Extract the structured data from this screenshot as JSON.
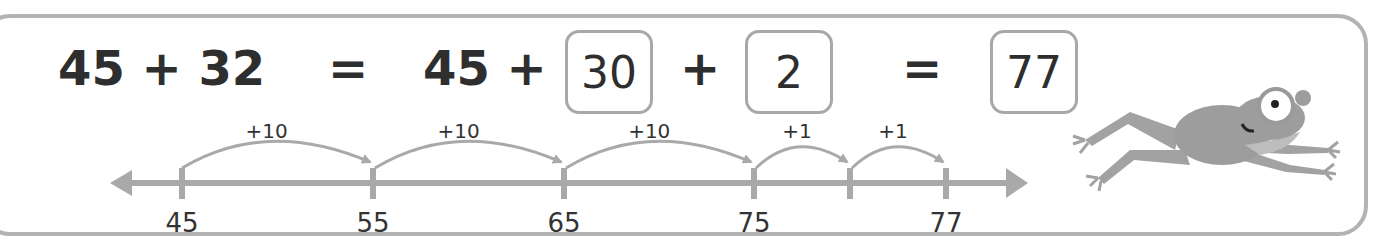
{
  "equation": {
    "left_expression": "45 + 32",
    "equals_1": "=",
    "first_addend": "45 +",
    "box_tens": "30",
    "plus": "+",
    "box_ones": "2",
    "equals_2": "=",
    "box_result": "77"
  },
  "number_line": {
    "ticks": [
      {
        "value": "45",
        "x": 182
      },
      {
        "value": "55",
        "x": 373
      },
      {
        "value": "65",
        "x": 564
      },
      {
        "value": "75",
        "x": 754
      },
      {
        "value": "",
        "x": 850
      },
      {
        "value": "77",
        "x": 946
      }
    ],
    "jumps": [
      {
        "label": "+10",
        "from_x": 182,
        "to_x": 370
      },
      {
        "label": "+10",
        "from_x": 375,
        "to_x": 561
      },
      {
        "label": "+10",
        "from_x": 566,
        "to_x": 751
      },
      {
        "label": "+1",
        "from_x": 756,
        "to_x": 847
      },
      {
        "label": "+1",
        "from_x": 852,
        "to_x": 943
      }
    ]
  },
  "colors": {
    "line": "#a9a9a9",
    "frame": "#b3b3b3",
    "text": "#2e2e2e",
    "frog_body": "#9a9a9a",
    "frog_belly": "#b8b8b8"
  }
}
